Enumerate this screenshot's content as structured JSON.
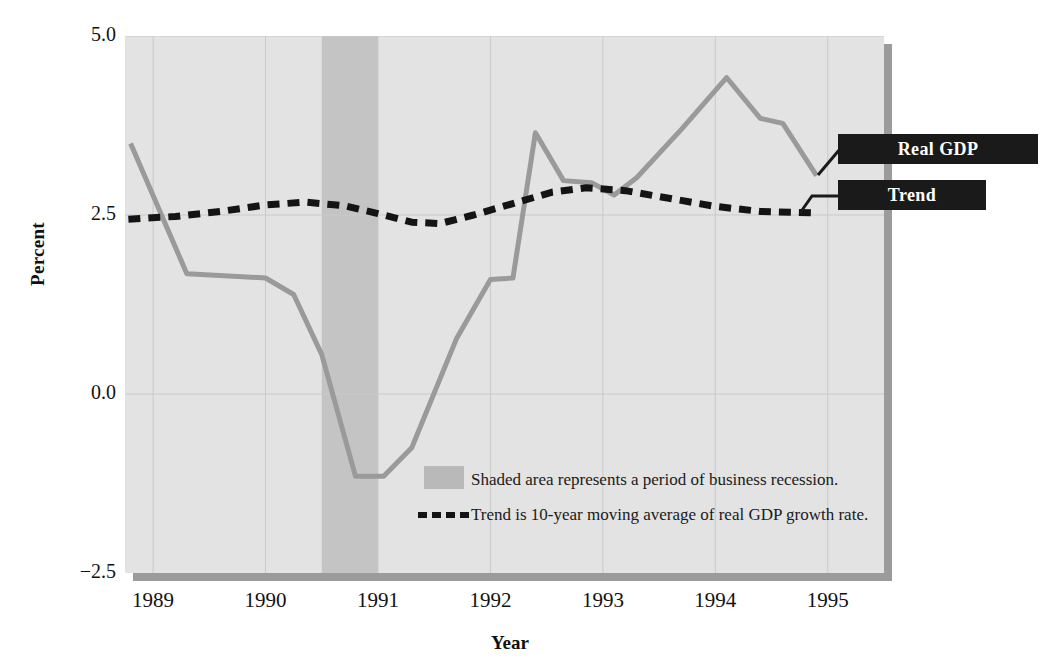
{
  "figure": {
    "axes": {
      "ylabel": "Percent",
      "xlabel": "Year",
      "yticks": [
        "5.0",
        "2.5",
        "0.0",
        "−2.5"
      ],
      "ytick_values": [
        5.0,
        2.5,
        0.0,
        -2.5
      ],
      "xticks": [
        "1989",
        "1990",
        "1991",
        "1992",
        "1993",
        "1994",
        "1995"
      ],
      "xtick_values": [
        1989,
        1990,
        1991,
        1992,
        1993,
        1994,
        1995
      ]
    },
    "callouts": {
      "real_gdp": "Real GDP",
      "trend": "Trend"
    },
    "notes": {
      "recession": "Shaded area represents a period of business recession.",
      "trend": "Trend is 10-year moving average of real GDP growth rate."
    },
    "colors": {
      "plot_background": "#e3e3e3",
      "recession_band": "#c4c4c4",
      "real_gdp_line": "#9a9a9a",
      "trend_line": "#141414",
      "callout_background": "#1a1a1a",
      "callout_text": "#ffffff",
      "gridline": "#c9c9c9",
      "shadow": "#9b9b9b"
    }
  },
  "chart_data": {
    "type": "line",
    "title": "",
    "xlabel": "Year",
    "ylabel": "Percent",
    "xlim": [
      1988.75,
      1995.5
    ],
    "ylim": [
      -2.5,
      5.0
    ],
    "yticks": [
      -2.5,
      0.0,
      2.5,
      5.0
    ],
    "xticks": [
      1989,
      1990,
      1991,
      1992,
      1993,
      1994,
      1995
    ],
    "grid": true,
    "legend_position": "callout-labels-right",
    "shaded_regions": [
      {
        "label": "business recession",
        "x_start": 1990.5,
        "x_end": 1991.0,
        "color": "#c4c4c4"
      }
    ],
    "series": [
      {
        "name": "Real GDP",
        "style": "solid",
        "color": "#9a9a9a",
        "points": [
          {
            "x": 1988.8,
            "y": 3.5
          },
          {
            "x": 1989.3,
            "y": 1.68
          },
          {
            "x": 1989.55,
            "y": 1.66
          },
          {
            "x": 1990.0,
            "y": 1.62
          },
          {
            "x": 1990.25,
            "y": 1.39
          },
          {
            "x": 1990.5,
            "y": 0.55
          },
          {
            "x": 1990.8,
            "y": -1.15
          },
          {
            "x": 1991.05,
            "y": -1.15
          },
          {
            "x": 1991.3,
            "y": -0.75
          },
          {
            "x": 1991.7,
            "y": 0.78
          },
          {
            "x": 1992.0,
            "y": 1.6
          },
          {
            "x": 1992.2,
            "y": 1.62
          },
          {
            "x": 1992.4,
            "y": 3.65
          },
          {
            "x": 1992.65,
            "y": 2.98
          },
          {
            "x": 1992.9,
            "y": 2.95
          },
          {
            "x": 1993.1,
            "y": 2.78
          },
          {
            "x": 1993.3,
            "y": 3.02
          },
          {
            "x": 1993.7,
            "y": 3.7
          },
          {
            "x": 1994.1,
            "y": 4.42
          },
          {
            "x": 1994.4,
            "y": 3.85
          },
          {
            "x": 1994.6,
            "y": 3.78
          },
          {
            "x": 1994.9,
            "y": 3.05
          }
        ]
      },
      {
        "name": "Trend",
        "style": "dashed",
        "color": "#141414",
        "description": "10-year moving average of real GDP growth rate",
        "points": [
          {
            "x": 1988.78,
            "y": 2.44
          },
          {
            "x": 1989.2,
            "y": 2.48
          },
          {
            "x": 1989.6,
            "y": 2.55
          },
          {
            "x": 1990.0,
            "y": 2.64
          },
          {
            "x": 1990.35,
            "y": 2.68
          },
          {
            "x": 1990.7,
            "y": 2.63
          },
          {
            "x": 1991.0,
            "y": 2.52
          },
          {
            "x": 1991.3,
            "y": 2.4
          },
          {
            "x": 1991.55,
            "y": 2.38
          },
          {
            "x": 1991.85,
            "y": 2.5
          },
          {
            "x": 1992.2,
            "y": 2.66
          },
          {
            "x": 1992.55,
            "y": 2.82
          },
          {
            "x": 1992.85,
            "y": 2.88
          },
          {
            "x": 1993.2,
            "y": 2.84
          },
          {
            "x": 1993.6,
            "y": 2.73
          },
          {
            "x": 1994.0,
            "y": 2.62
          },
          {
            "x": 1994.4,
            "y": 2.55
          },
          {
            "x": 1994.85,
            "y": 2.53
          }
        ]
      }
    ]
  }
}
